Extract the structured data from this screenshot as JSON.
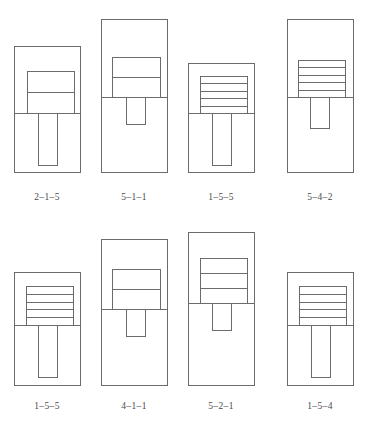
{
  "plate": {
    "width": 369,
    "height": 424,
    "background": "#ffffff",
    "line_color": "#6b6b6b",
    "fill_color": "#ffffff",
    "caption_color": "#4a4a4a",
    "rows": 2,
    "columns": 4
  },
  "figures": [
    {
      "id": "figure-1",
      "caption": "2–1–5",
      "row": 0,
      "column": 0,
      "outer": {
        "x": 14,
        "y": 46,
        "w": 66,
        "h": 126
      },
      "divider_y": 113,
      "block": {
        "x": 27,
        "y": 71,
        "w": 47,
        "h": 42
      },
      "stripes": 2,
      "tongue": {
        "x": 38,
        "y": 113,
        "w": 19,
        "h": 52
      }
    },
    {
      "id": "figure-2",
      "caption": "5–1–1",
      "row": 0,
      "column": 1,
      "outer": {
        "x": 101,
        "y": 19,
        "w": 66,
        "h": 153
      },
      "divider_y": 97,
      "block": {
        "x": 112,
        "y": 57,
        "w": 48,
        "h": 40
      },
      "stripes": 2,
      "tongue": {
        "x": 126,
        "y": 97,
        "w": 19,
        "h": 27
      }
    },
    {
      "id": "figure-3",
      "caption": "1–5–5",
      "row": 0,
      "column": 2,
      "outer": {
        "x": 188,
        "y": 63,
        "w": 66,
        "h": 109
      },
      "divider_y": 113,
      "block": {
        "x": 200,
        "y": 76,
        "w": 47,
        "h": 37
      },
      "stripes": 5,
      "tongue": {
        "x": 212,
        "y": 113,
        "w": 19,
        "h": 52
      }
    },
    {
      "id": "figure-4",
      "caption": "5–4–2",
      "row": 0,
      "column": 3,
      "outer": {
        "x": 287,
        "y": 19,
        "w": 66,
        "h": 153
      },
      "divider_y": 97,
      "block": {
        "x": 298,
        "y": 60,
        "w": 47,
        "h": 37
      },
      "stripes": 5,
      "tongue": {
        "x": 310,
        "y": 97,
        "w": 19,
        "h": 31
      }
    },
    {
      "id": "figure-5",
      "caption": "1–5–5",
      "row": 1,
      "column": 0,
      "outer": {
        "x": 14,
        "y": 272,
        "w": 66,
        "h": 113
      },
      "divider_y": 325,
      "block": {
        "x": 26,
        "y": 286,
        "w": 47,
        "h": 39
      },
      "stripes": 5,
      "tongue": {
        "x": 38,
        "y": 325,
        "w": 19,
        "h": 52
      }
    },
    {
      "id": "figure-6",
      "caption": "4–1–1",
      "row": 1,
      "column": 1,
      "outer": {
        "x": 101,
        "y": 239,
        "w": 66,
        "h": 146
      },
      "divider_y": 309,
      "block": {
        "x": 112,
        "y": 269,
        "w": 48,
        "h": 40
      },
      "stripes": 2,
      "tongue": {
        "x": 126,
        "y": 309,
        "w": 19,
        "h": 27
      }
    },
    {
      "id": "figure-7",
      "caption": "5–2–1",
      "row": 1,
      "column": 2,
      "outer": {
        "x": 188,
        "y": 232,
        "w": 66,
        "h": 153
      },
      "divider_y": 303,
      "block": {
        "x": 200,
        "y": 258,
        "w": 47,
        "h": 45
      },
      "stripes": 3,
      "tongue": {
        "x": 212,
        "y": 303,
        "w": 19,
        "h": 27
      }
    },
    {
      "id": "figure-8",
      "caption": "1–5–4",
      "row": 1,
      "column": 3,
      "outer": {
        "x": 287,
        "y": 272,
        "w": 66,
        "h": 113
      },
      "divider_y": 325,
      "block": {
        "x": 299,
        "y": 286,
        "w": 47,
        "h": 39
      },
      "stripes": 5,
      "tongue": {
        "x": 311,
        "y": 325,
        "w": 19,
        "h": 52
      }
    }
  ],
  "captions": {
    "row_top": [
      "2–1–5",
      "5–1–5",
      "1–5–5",
      "5–4–2"
    ],
    "row_bottom": [
      "1–5–5",
      "4–1–1",
      "5–2–1",
      "1–5–4"
    ],
    "top_y": 192,
    "bottom_y": 401
  }
}
